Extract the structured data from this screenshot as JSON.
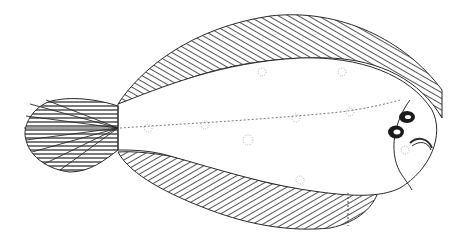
{
  "figure": {
    "colors": {
      "background": "#ffffff",
      "ink": "#2a2a2a"
    }
  }
}
